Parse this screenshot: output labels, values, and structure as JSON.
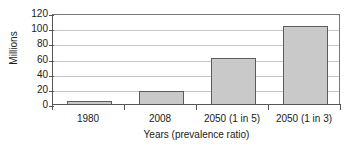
{
  "chart_data": {
    "type": "bar",
    "title": "",
    "categories": [
      "1980",
      "2008",
      "2050 (1 in 5)",
      "2050 (1 in 3)"
    ],
    "values": [
      5,
      18,
      62,
      104
    ],
    "xlabel": "Years (prevalence ratio)",
    "ylabel": "Millions",
    "ylim": [
      0,
      120
    ],
    "ytick_values": [
      0,
      20,
      40,
      60,
      80,
      100,
      120
    ],
    "ytick_labels": [
      "0",
      "20",
      "40",
      "60",
      "80",
      "100",
      "120"
    ],
    "grid": true,
    "legend": false,
    "colors": {
      "bar_fill": "#c9c9c9",
      "bar_border": "#5c5c5c",
      "gridline": "#c5c5c5",
      "axis": "#555555",
      "background": "#ffffff"
    }
  }
}
